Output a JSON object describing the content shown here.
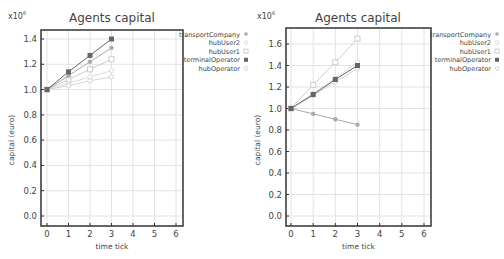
{
  "chart_data": [
    {
      "type": "line",
      "title": "Agents capital",
      "xlabel": "time tick",
      "ylabel": "capital (euro)",
      "y_multiplier": "x10^6",
      "x_ticks": [
        "0",
        "1",
        "2",
        "3",
        "4",
        "5",
        "6"
      ],
      "y_ticks": [
        "0.0",
        "0.2",
        "0.4",
        "0.6",
        "0.8",
        "1.0",
        "1.2",
        "1.4"
      ],
      "xlim": [
        0,
        6
      ],
      "ylim": [
        0.0,
        1.4
      ],
      "grid": true,
      "legend_position": "right",
      "x": [
        0,
        1,
        2,
        3
      ],
      "series": [
        {
          "name": "transportCompany",
          "marker": "circle-filled",
          "color": "#aaaaaa",
          "values": [
            1.0,
            1.11,
            1.22,
            1.33
          ]
        },
        {
          "name": "hubUser2",
          "marker": "circle-light",
          "color": "#dddddd",
          "values": [
            1.0,
            1.05,
            1.1,
            1.15
          ]
        },
        {
          "name": "hubUser1",
          "marker": "square-open",
          "color": "#cccccc",
          "values": [
            1.0,
            1.08,
            1.16,
            1.24
          ]
        },
        {
          "name": "terminalOperator",
          "marker": "square-filled",
          "color": "#666666",
          "values": [
            1.0,
            1.14,
            1.27,
            1.4
          ]
        },
        {
          "name": "hubOperator",
          "marker": "circle-light",
          "color": "#d5d5d5",
          "values": [
            1.0,
            1.03,
            1.07,
            1.1
          ]
        }
      ]
    },
    {
      "type": "line",
      "title": "Agents capital",
      "xlabel": "time tick",
      "ylabel": "capital (euro)",
      "y_multiplier": "x10^6",
      "x_ticks": [
        "0",
        "1",
        "2",
        "3",
        "4",
        "5",
        "6"
      ],
      "y_ticks": [
        "0.0",
        "0.2",
        "0.4",
        "0.6",
        "0.8",
        "1.0",
        "1.2",
        "1.4",
        "1.6"
      ],
      "xlim": [
        0,
        6
      ],
      "ylim": [
        0.0,
        1.6
      ],
      "grid": true,
      "legend_position": "right",
      "x": [
        0,
        1,
        2,
        3
      ],
      "series": [
        {
          "name": "transportCompany",
          "marker": "circle-filled",
          "color": "#aaaaaa",
          "values": [
            1.0,
            0.95,
            0.9,
            0.85
          ]
        },
        {
          "name": "hubUser2",
          "marker": "circle-light",
          "color": "#dddddd",
          "values": [
            1.0,
            1.14,
            1.28,
            1.43
          ]
        },
        {
          "name": "hubUser1",
          "marker": "square-open",
          "color": "#cccccc",
          "values": [
            1.0,
            1.22,
            1.43,
            1.65
          ]
        },
        {
          "name": "terminalOperator",
          "marker": "square-filled",
          "color": "#666666",
          "values": [
            1.0,
            1.13,
            1.27,
            1.4
          ]
        },
        {
          "name": "hubOperator",
          "marker": "circle-light",
          "color": "#d5d5d5",
          "values": [
            1.0,
            1.12,
            1.25,
            1.37
          ]
        }
      ]
    }
  ],
  "charts": [
    {
      "title": "Agents capital",
      "xlabel": "time tick",
      "ylabel": "capital (euro)",
      "multiplier": "x10",
      "multiplier_exp": "6"
    },
    {
      "title": "Agents capital",
      "xlabel": "time tick",
      "ylabel": "capital (euro)",
      "multiplier": "x10",
      "multiplier_exp": "6"
    }
  ]
}
